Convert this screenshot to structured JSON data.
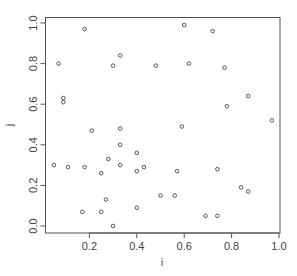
{
  "chart_data": {
    "type": "scatter",
    "title": "",
    "xlabel": "i",
    "ylabel": "j",
    "xlim": [
      0.0,
      1.0
    ],
    "ylim": [
      0.0,
      1.0
    ],
    "xticks": [
      0.2,
      0.4,
      0.6,
      0.8,
      1.0
    ],
    "xtick_labels": [
      "0.2",
      "0.4",
      "0.6",
      "0.8",
      "1.0"
    ],
    "yticks": [
      0.0,
      0.2,
      0.4,
      0.6,
      0.8,
      1.0
    ],
    "ytick_labels": [
      "0.0",
      "0.2",
      "0.4",
      "0.6",
      "0.8",
      "1.0"
    ],
    "grid": false,
    "legend": null,
    "marker": "open-circle",
    "points": [
      {
        "x": 0.18,
        "y": 0.97
      },
      {
        "x": 0.07,
        "y": 0.8
      },
      {
        "x": 0.3,
        "y": 0.79
      },
      {
        "x": 0.33,
        "y": 0.84
      },
      {
        "x": 0.09,
        "y": 0.63
      },
      {
        "x": 0.09,
        "y": 0.61
      },
      {
        "x": 0.21,
        "y": 0.47
      },
      {
        "x": 0.33,
        "y": 0.48
      },
      {
        "x": 0.33,
        "y": 0.4
      },
      {
        "x": 0.28,
        "y": 0.33
      },
      {
        "x": 0.05,
        "y": 0.3
      },
      {
        "x": 0.11,
        "y": 0.29
      },
      {
        "x": 0.18,
        "y": 0.29
      },
      {
        "x": 0.33,
        "y": 0.3
      },
      {
        "x": 0.25,
        "y": 0.26
      },
      {
        "x": 0.4,
        "y": 0.27
      },
      {
        "x": 0.43,
        "y": 0.29
      },
      {
        "x": 0.4,
        "y": 0.36
      },
      {
        "x": 0.27,
        "y": 0.13
      },
      {
        "x": 0.17,
        "y": 0.07
      },
      {
        "x": 0.25,
        "y": 0.07
      },
      {
        "x": 0.4,
        "y": 0.09
      },
      {
        "x": 0.3,
        "y": 0.0
      },
      {
        "x": 0.6,
        "y": 0.99
      },
      {
        "x": 0.72,
        "y": 0.96
      },
      {
        "x": 0.48,
        "y": 0.79
      },
      {
        "x": 0.62,
        "y": 0.8
      },
      {
        "x": 0.77,
        "y": 0.78
      },
      {
        "x": 0.87,
        "y": 0.64
      },
      {
        "x": 0.78,
        "y": 0.59
      },
      {
        "x": 0.97,
        "y": 0.52
      },
      {
        "x": 0.59,
        "y": 0.49
      },
      {
        "x": 0.57,
        "y": 0.27
      },
      {
        "x": 0.74,
        "y": 0.28
      },
      {
        "x": 0.5,
        "y": 0.15
      },
      {
        "x": 0.56,
        "y": 0.15
      },
      {
        "x": 0.84,
        "y": 0.19
      },
      {
        "x": 0.87,
        "y": 0.17
      },
      {
        "x": 0.69,
        "y": 0.05
      },
      {
        "x": 0.74,
        "y": 0.05
      }
    ]
  }
}
